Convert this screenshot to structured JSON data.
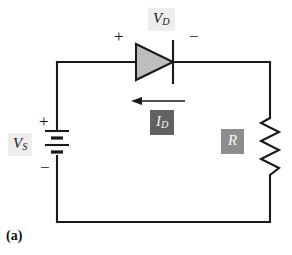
{
  "figure": {
    "caption": "(a)"
  },
  "labels": {
    "source_voltage": {
      "symbol": "V",
      "subscript": "S",
      "chip_color": "#ededed",
      "text_color": "#1a1a1a"
    },
    "diode_voltage": {
      "symbol": "V",
      "subscript": "D",
      "chip_color": "#ededed",
      "text_color": "#1a1a1a"
    },
    "diode_current": {
      "symbol": "I",
      "subscript": "D",
      "chip_color": "#616161",
      "text_color": "#f2f2f2"
    },
    "resistor": {
      "symbol": "R",
      "subscript": "",
      "chip_color": "#8d8d8d",
      "text_color": "#f7f7f7"
    }
  },
  "polarity": {
    "diode_anode": "+",
    "diode_cathode": "−",
    "battery_positive": "+",
    "battery_negative": "−"
  },
  "components": {
    "diode": {
      "name": "diode",
      "fill": "#bdbdbd",
      "stroke": "#1a1a1a",
      "orientation": "anode-left-cathode-right"
    },
    "battery": {
      "name": "battery",
      "cells": 2,
      "stroke": "#1a1a1a",
      "positive_terminal": "top"
    },
    "resistor": {
      "name": "resistor",
      "zigzag_peaks": 6,
      "stroke": "#1a1a1a"
    },
    "current_arrow": {
      "name": "current-arrow",
      "direction": "left",
      "stroke": "#1a1a1a"
    },
    "wire": {
      "stroke": "#1a1a1a",
      "width": 2
    }
  }
}
